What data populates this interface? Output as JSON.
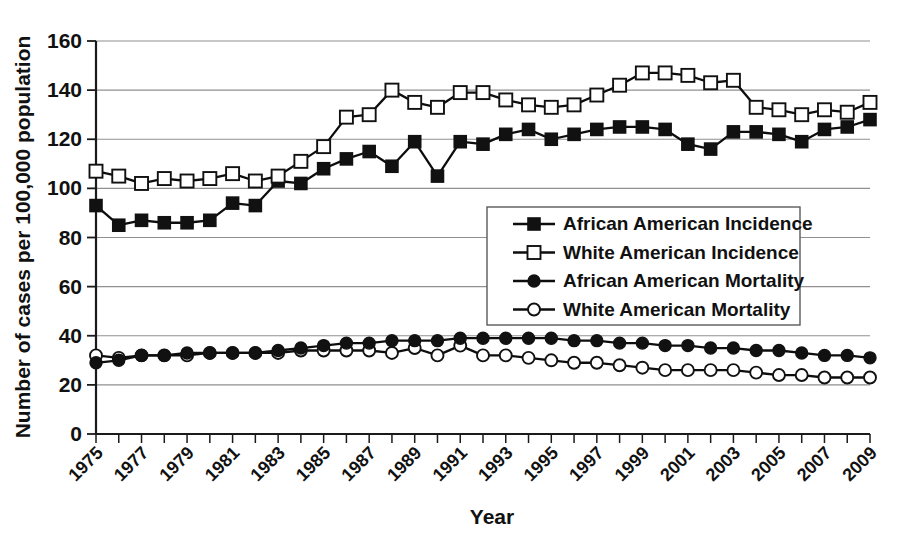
{
  "chart_data": {
    "type": "line",
    "title": "",
    "xlabel": "Year",
    "ylabel": "Number of cases per 100,000 population",
    "xlim": [
      1975,
      2009
    ],
    "ylim": [
      0,
      160
    ],
    "ytick_step": 20,
    "xtick_label_step": 2,
    "grid": "horizontal",
    "legend_position": "center",
    "yticks": [
      "0",
      "20",
      "40",
      "60",
      "80",
      "100",
      "120",
      "140",
      "160"
    ],
    "xticks": [
      "1975",
      "1976",
      "1977",
      "1978",
      "1979",
      "1980",
      "1981",
      "1982",
      "1983",
      "1984",
      "1985",
      "1986",
      "1987",
      "1988",
      "1989",
      "1990",
      "1991",
      "1992",
      "1993",
      "1994",
      "1995",
      "1996",
      "1997",
      "1998",
      "1999",
      "2000",
      "2001",
      "2002",
      "2003",
      "2004",
      "2005",
      "2006",
      "2007",
      "2008",
      "2009"
    ],
    "xtick_labels_shown": [
      "1975",
      "1977",
      "1979",
      "1981",
      "1983",
      "1985",
      "1987",
      "1989",
      "1991",
      "1993",
      "1995",
      "1997",
      "1999",
      "2001",
      "2003",
      "2005",
      "2007",
      "2009"
    ],
    "x": [
      1975,
      1976,
      1977,
      1978,
      1979,
      1980,
      1981,
      1982,
      1983,
      1984,
      1985,
      1986,
      1987,
      1988,
      1989,
      1990,
      1991,
      1992,
      1993,
      1994,
      1995,
      1996,
      1997,
      1998,
      1999,
      2000,
      2001,
      2002,
      2003,
      2004,
      2005,
      2006,
      2007,
      2008,
      2009
    ],
    "series": [
      {
        "name": "African American Incidence",
        "marker": "filled-square",
        "values": [
          93,
          85,
          87,
          86,
          86,
          87,
          94,
          93,
          103,
          102,
          108,
          112,
          115,
          109,
          119,
          105,
          119,
          118,
          122,
          124,
          120,
          122,
          124,
          125,
          125,
          124,
          118,
          116,
          123,
          123,
          122,
          119,
          124,
          125,
          128
        ]
      },
      {
        "name": "White American Incidence",
        "marker": "open-square",
        "values": [
          107,
          105,
          102,
          104,
          103,
          104,
          106,
          103,
          105,
          111,
          117,
          129,
          130,
          140,
          135,
          133,
          139,
          139,
          136,
          134,
          133,
          134,
          138,
          142,
          147,
          147,
          146,
          143,
          144,
          133,
          132,
          130,
          132,
          131,
          135
        ]
      },
      {
        "name": "African American Mortality",
        "marker": "filled-circle",
        "values": [
          29,
          30,
          32,
          32,
          33,
          33,
          33,
          33,
          34,
          35,
          36,
          37,
          37,
          38,
          38,
          38,
          39,
          39,
          39,
          39,
          39,
          38,
          38,
          37,
          37,
          36,
          36,
          35,
          35,
          34,
          34,
          33,
          32,
          32,
          31
        ]
      },
      {
        "name": "White American Mortality",
        "marker": "open-circle",
        "values": [
          32,
          31,
          32,
          32,
          32,
          33,
          33,
          33,
          33,
          34,
          34,
          34,
          34,
          33,
          35,
          32,
          36,
          32,
          32,
          31,
          30,
          29,
          29,
          28,
          27,
          26,
          26,
          26,
          26,
          25,
          24,
          24,
          23,
          23,
          23
        ]
      }
    ]
  },
  "legend": {
    "items": [
      {
        "label": "African American Incidence",
        "marker": "filled-square"
      },
      {
        "label": "White American Incidence",
        "marker": "open-square"
      },
      {
        "label": "African American Mortality",
        "marker": "filled-circle"
      },
      {
        "label": "White American Mortality",
        "marker": "open-circle"
      }
    ]
  },
  "colors": {
    "ink": "#111111",
    "grid": "#909090",
    "background": "#ffffff"
  }
}
